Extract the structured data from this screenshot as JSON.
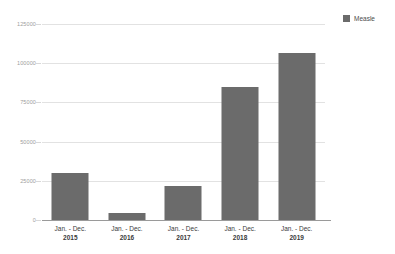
{
  "chart_data": {
    "type": "bar",
    "title": "",
    "subtitle": "",
    "xlabel": "",
    "ylabel": "",
    "categories": [
      "Jan. - Dec. 2015",
      "Jan. - Dec. 2016",
      "Jan. - Dec. 2017",
      "Jan. - Dec. 2018",
      "Jan. - Dec. 2019"
    ],
    "category_parts": [
      {
        "period": "Jan. - Dec.",
        "year": "2015"
      },
      {
        "period": "Jan. - Dec.",
        "year": "2016"
      },
      {
        "period": "Jan. - Dec.",
        "year": "2017"
      },
      {
        "period": "Jan. - Dec.",
        "year": "2018"
      },
      {
        "period": "Jan. - Dec.",
        "year": "2019"
      }
    ],
    "series": [
      {
        "name": "Measle",
        "color": "#6b6b6b",
        "values": [
          30000,
          4700,
          22000,
          85000,
          106700
        ]
      }
    ],
    "ylim": [
      0,
      125000
    ],
    "yticks": [
      0,
      25000,
      50000,
      75000,
      100000,
      125000
    ],
    "ytick_labels": [
      "0",
      "25000",
      "50000",
      "75000",
      "100000",
      "125000"
    ],
    "grid": true,
    "legend_position": "top-right",
    "bar_color": "#6b6b6b",
    "gridline_color": "#e2e2e2",
    "axis_color": "#9a9a9a",
    "background_color": "#ffffff"
  },
  "legend": {
    "entries": [
      {
        "label": "Measle",
        "color": "#6b6b6b"
      }
    ]
  }
}
